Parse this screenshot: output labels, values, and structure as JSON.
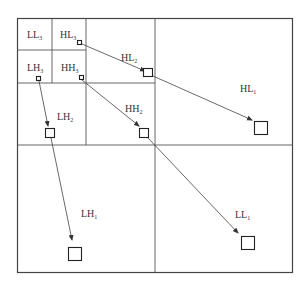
{
  "diagram": {
    "title": "",
    "type": "wavelet-decomposition-tree",
    "colors": {
      "line": "#555555",
      "box": "#222222",
      "text": "#333333",
      "background": "#ffffff"
    },
    "subbands": [
      {
        "id": "LL3",
        "base": "LL",
        "level": "3"
      },
      {
        "id": "HL3",
        "base": "HL",
        "level": "3"
      },
      {
        "id": "LH3",
        "base": "LH",
        "level": "3"
      },
      {
        "id": "HH3",
        "base": "HH",
        "level": "3"
      },
      {
        "id": "HL2",
        "base": "HL",
        "level": "2"
      },
      {
        "id": "LH2",
        "base": "LH",
        "level": "2"
      },
      {
        "id": "HH2",
        "base": "HH",
        "level": "2"
      },
      {
        "id": "HL1",
        "base": "HL",
        "level": "1"
      },
      {
        "id": "LH1",
        "base": "LH",
        "level": "1"
      },
      {
        "id": "LL1",
        "base": "LL",
        "level": "1"
      }
    ],
    "links": [
      {
        "from": "HL3",
        "to": "HL2"
      },
      {
        "from": "HL2",
        "to": "HL1"
      },
      {
        "from": "LH3",
        "to": "LH2"
      },
      {
        "from": "LH2",
        "to": "LH1"
      },
      {
        "from": "HH3",
        "to": "HH2"
      },
      {
        "from": "HH2",
        "to": "LL1"
      }
    ]
  }
}
